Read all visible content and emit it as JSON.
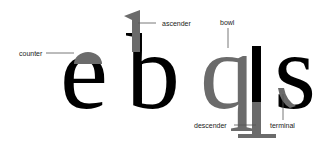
{
  "diagram": {
    "title": "",
    "letters": [
      "e",
      "b",
      "q",
      "s"
    ],
    "labels": {
      "counter": "counter",
      "ascender": "ascender",
      "bowl": "bowl",
      "descender": "descender",
      "terminal": "terminal"
    },
    "colors": {
      "glyph": "#000000",
      "highlight": "#6b6b6b",
      "leader": "#555555",
      "label": "#222222"
    }
  }
}
